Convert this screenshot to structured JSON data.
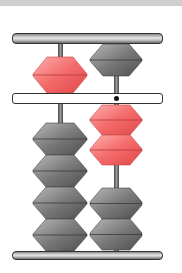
{
  "figure": {
    "type": "abacus",
    "rods": [
      {
        "position": "left",
        "heaven_bead": {
          "state": "active",
          "color": "red"
        },
        "earth_beads": [
          {
            "state": "inactive",
            "color": "gray"
          },
          {
            "state": "inactive",
            "color": "gray"
          },
          {
            "state": "inactive",
            "color": "gray"
          },
          {
            "state": "inactive",
            "color": "gray"
          }
        ],
        "digit": 5
      },
      {
        "position": "right",
        "heaven_bead": {
          "state": "inactive",
          "color": "gray"
        },
        "earth_beads": [
          {
            "state": "active",
            "color": "red"
          },
          {
            "state": "active",
            "color": "red"
          },
          {
            "state": "inactive",
            "color": "gray"
          },
          {
            "state": "inactive",
            "color": "gray"
          }
        ],
        "digit": 2,
        "unit_marker": true
      }
    ],
    "represented_value": 52
  },
  "colors": {
    "active_bead": "#f46a6a",
    "inactive_bead": "#6e6e6e",
    "frame": "#333333",
    "background": "#ffffff"
  }
}
